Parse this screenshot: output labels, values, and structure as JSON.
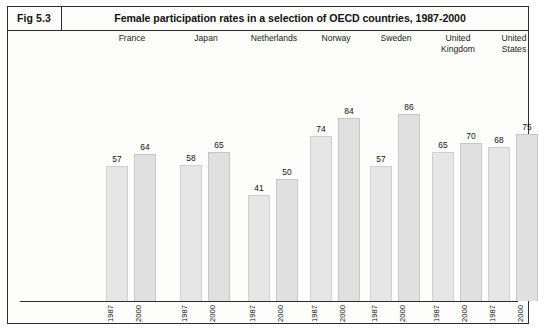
{
  "figure": {
    "number": "Fig 5.3",
    "title": "Female participation rates in a selection of OECD countries, 1987-2000"
  },
  "chart_data": {
    "type": "bar",
    "title": "Female participation rates in a selection of OECD countries, 1987-2000",
    "xlabel": "",
    "ylabel": "",
    "ylim": [
      0,
      100
    ],
    "grid": false,
    "legend": "none",
    "categories": [
      "France",
      "Japan",
      "Netherlands",
      "Norway",
      "Sweden",
      "United Kingdom",
      "United States"
    ],
    "subcategories": [
      "1987",
      "2000"
    ],
    "series": [
      {
        "name": "1987",
        "values": [
          57,
          58,
          41,
          74,
          57,
          65,
          68
        ]
      },
      {
        "name": "2000",
        "values": [
          64,
          65,
          50,
          84,
          86,
          70,
          75
        ]
      }
    ],
    "groups": [
      {
        "label": "France",
        "bars": [
          {
            "year": "1987",
            "value": 57
          },
          {
            "year": "2000",
            "value": 64
          }
        ]
      },
      {
        "label": "Japan",
        "bars": [
          {
            "year": "1987",
            "value": 58
          },
          {
            "year": "2000",
            "value": 65
          }
        ]
      },
      {
        "label": "Netherlands",
        "bars": [
          {
            "year": "1987",
            "value": 41
          },
          {
            "year": "2000",
            "value": 50
          }
        ]
      },
      {
        "label": "Norway",
        "bars": [
          {
            "year": "1987",
            "value": 74
          },
          {
            "year": "2000",
            "value": 84
          }
        ]
      },
      {
        "label": "Sweden",
        "bars": [
          {
            "year": "1987",
            "value": 57
          },
          {
            "year": "2000",
            "value": 86
          }
        ]
      },
      {
        "label": "United Kingdom",
        "bars": [
          {
            "year": "1987",
            "value": 65
          },
          {
            "year": "2000",
            "value": 70
          }
        ]
      },
      {
        "label": "United States",
        "bars": [
          {
            "year": "1987",
            "value": 68
          },
          {
            "year": "2000",
            "value": 75
          }
        ]
      }
    ],
    "colors": {
      "bar_fill": "#e6e6e6",
      "bar_border": "#cfcfcf",
      "text": "#111111",
      "frame": "#2b2b2b"
    }
  }
}
